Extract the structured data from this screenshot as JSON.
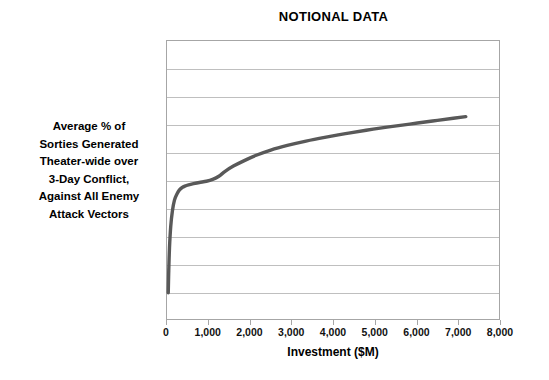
{
  "chart_data": {
    "type": "line",
    "title": "NOTIONAL DATA",
    "xlabel": "Investment ($M)",
    "ylabel": "Average % of Sorties Generated Theater-wide over 3-Day Conflict, Against All Enemy Attack Vectors",
    "ylabel_lines": [
      "Average % of",
      "Sorties Generated",
      "Theater-wide over",
      "3-Day Conflict,",
      "Against All Enemy",
      "Attack Vectors"
    ],
    "xlim": [
      0,
      8000
    ],
    "ylim": [
      0,
      9
    ],
    "xticks": [
      0,
      1000,
      2000,
      3000,
      4000,
      5000,
      6000,
      7000,
      8000
    ],
    "xticklabels": [
      "0",
      "1,000",
      "2,000",
      "3,000",
      "4,000",
      "5,000",
      "6,000",
      "7,000",
      "8,000"
    ],
    "yticks": [],
    "yticklabels": [],
    "grid": "horizontal",
    "gridline_count": 9,
    "legend": "none",
    "series": [
      {
        "name": "Average % of sorties generated",
        "color": "#595959",
        "line_width": 3.4,
        "x": [
          30,
          40,
          60,
          90,
          130,
          180,
          240,
          300,
          360,
          430,
          520,
          640,
          780,
          950,
          1100,
          1250,
          1400,
          1600,
          1850,
          2150,
          2500,
          2900,
          3350,
          3800,
          4300,
          4800,
          5300,
          5850,
          6400,
          6900,
          7200
        ],
        "y": [
          0.85,
          1.45,
          2.3,
          3.0,
          3.5,
          3.85,
          4.05,
          4.18,
          4.25,
          4.3,
          4.34,
          4.38,
          4.42,
          4.46,
          4.52,
          4.62,
          4.78,
          4.95,
          5.12,
          5.3,
          5.47,
          5.62,
          5.76,
          5.88,
          6.0,
          6.11,
          6.21,
          6.31,
          6.41,
          6.5,
          6.55
        ]
      }
    ]
  },
  "colors": {
    "series": "#595959",
    "gridline": "#bfbfbf",
    "axis": "#a6a6a6",
    "text": "#000000",
    "background": "#ffffff"
  }
}
